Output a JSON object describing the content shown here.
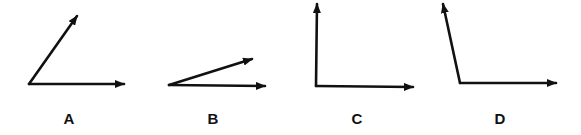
{
  "figure": {
    "panels": [
      {
        "label": "A",
        "vertex": [
          29,
          84
        ],
        "ray1_tip": [
          124,
          84
        ],
        "ray2_tip": [
          77,
          16
        ],
        "label_pos": [
          69,
          124
        ],
        "angle_type": "acute (~55°)"
      },
      {
        "label": "B",
        "vertex": [
          169,
          85
        ],
        "ray1_tip": [
          265,
          86
        ],
        "ray2_tip": [
          252,
          59
        ],
        "label_pos": [
          213,
          124
        ],
        "angle_type": "acute (~18°)"
      },
      {
        "label": "C",
        "vertex": [
          316,
          86
        ],
        "ray1_tip": [
          413,
          87
        ],
        "ray2_tip": [
          317,
          4
        ],
        "label_pos": [
          357,
          124
        ],
        "angle_type": "right (90°)"
      },
      {
        "label": "D",
        "vertex": [
          460,
          83
        ],
        "ray1_tip": [
          556,
          83
        ],
        "ray2_tip": [
          443,
          4
        ],
        "label_pos": [
          500,
          124
        ],
        "angle_type": "obtuse (~102°)"
      }
    ],
    "colors": {
      "stroke": "#111111",
      "background": "#ffffff"
    }
  }
}
